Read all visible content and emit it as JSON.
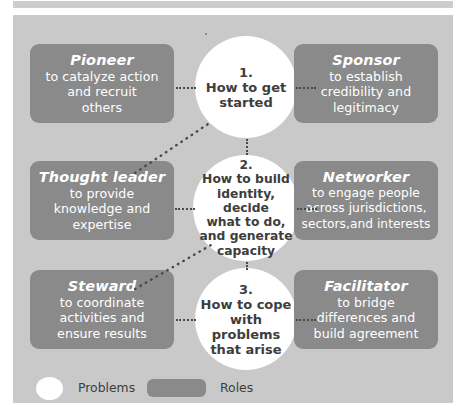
{
  "figure": {
    "background_color": "#c9c9c9",
    "role_box_color": "#8a8a8a",
    "problem_circle_color": "#ffffff",
    "connector_color": "#4a4a4a"
  },
  "problems": [
    {
      "number": "1.",
      "line1": "How to get",
      "line2": "started",
      "line3": "",
      "line4": "",
      "line5": ""
    },
    {
      "number": "2.",
      "line1": "How to build",
      "line2": "identity, decide",
      "line3": "what to do,",
      "line4": "and generate",
      "line5": "capacity"
    },
    {
      "number": "3.",
      "line1": "How to cope",
      "line2": "with problems",
      "line3": "that arise",
      "line4": "",
      "line5": ""
    }
  ],
  "roles": [
    {
      "title": "Pioneer",
      "line1": "to catalyze action",
      "line2": "and recruit",
      "line3": "others"
    },
    {
      "title": "Sponsor",
      "line1": "to establish",
      "line2": "credibility and",
      "line3": "legitimacy"
    },
    {
      "title": "Thought leader",
      "line1": "to provide",
      "line2": "knowledge and",
      "line3": "expertise"
    },
    {
      "title": "Networker",
      "line1": "to engage people",
      "line2": "across jurisdictions,",
      "line3": "sectors,and interests"
    },
    {
      "title": "Steward",
      "line1": "to coordinate",
      "line2": "activities and",
      "line3": "ensure results"
    },
    {
      "title": "Facilitator",
      "line1": "to bridge",
      "line2": "differences and",
      "line3": "build agreement"
    }
  ],
  "legend": {
    "problems_label": "Problems",
    "roles_label": "Roles"
  }
}
